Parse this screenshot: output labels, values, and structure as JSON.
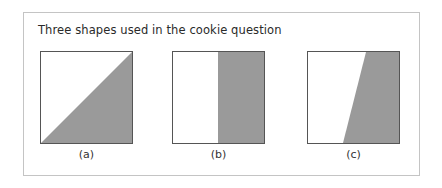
{
  "figure": {
    "caption": "Three shapes used in the cookie question",
    "colors": {
      "fill": "#9a9a9a",
      "border": "#555555",
      "frame": "#c4c4c4"
    },
    "shapes": [
      {
        "label": "(a)",
        "type": "diagonal-triangle"
      },
      {
        "label": "(b)",
        "type": "vertical-split"
      },
      {
        "label": "(c)",
        "type": "slanted-trapezoid"
      }
    ]
  }
}
